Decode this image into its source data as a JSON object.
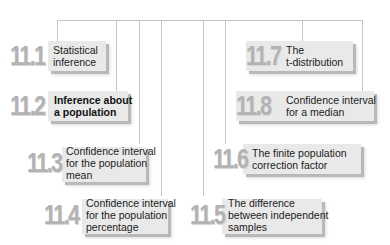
{
  "diagram": {
    "title": "",
    "connector_color": "#c4c4c4",
    "box_color": "#e9e9e9",
    "number_color": "#b3b3b3",
    "nodes": [
      {
        "id": "11.1",
        "number": "11.1",
        "label": "Statistical\ninference",
        "highlighted": false
      },
      {
        "id": "11.2",
        "number": "11.2",
        "label": "Inference about\na population",
        "highlighted": true
      },
      {
        "id": "11.3",
        "number": "11.3",
        "label": "Confidence interval\nfor the population\nmean",
        "highlighted": false
      },
      {
        "id": "11.4",
        "number": "11.4",
        "label": "Confidence interval\nfor the population\npercentage",
        "highlighted": false
      },
      {
        "id": "11.5",
        "number": "11.5",
        "label": "The difference\nbetween independent\nsamples",
        "highlighted": false
      },
      {
        "id": "11.6",
        "number": "11.6",
        "label": "The finite population\ncorrection factor",
        "highlighted": false
      },
      {
        "id": "11.7",
        "number": "11.7",
        "label": "The\nt-distribution",
        "highlighted": false
      },
      {
        "id": "11.8",
        "number": "11.8",
        "label": "Confidence interval\nfor a median",
        "highlighted": false
      }
    ]
  }
}
